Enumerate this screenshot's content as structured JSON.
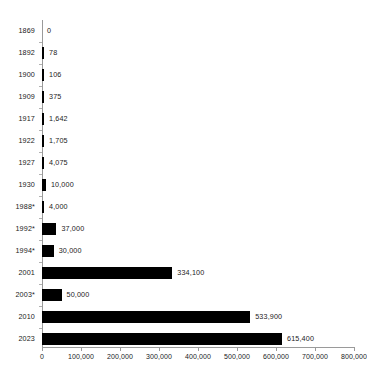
{
  "chart_data": {
    "type": "bar",
    "orientation": "horizontal",
    "title": "",
    "subtitle": "",
    "xlabel": "",
    "ylabel": "",
    "grid": false,
    "legend": null,
    "legend_position": "none",
    "xlim": [
      0,
      800000
    ],
    "x_ticks": [
      0,
      100000,
      200000,
      300000,
      400000,
      500000,
      600000,
      700000,
      800000
    ],
    "x_tick_labels": [
      "0",
      "100,000",
      "200,000",
      "300,000",
      "400,000",
      "500,000",
      "600,000",
      "700,000",
      "800,000"
    ],
    "categories": [
      "1869",
      "1892",
      "1900",
      "1909",
      "1917",
      "1922",
      "1927",
      "1930",
      "1988*",
      "1992*",
      "1994*",
      "2001",
      "2003*",
      "2010",
      "2023"
    ],
    "values": [
      0,
      78,
      106,
      375,
      1642,
      1705,
      4075,
      10000,
      4000,
      37000,
      30000,
      334100,
      50000,
      533900,
      615400
    ],
    "value_labels": [
      "0",
      "78",
      "106",
      "375",
      "1,642",
      "1,705",
      "4,075",
      "10,000",
      "4,000",
      "37,000",
      "30,000",
      "334,100",
      "50,000",
      "533,900",
      "615,400"
    ],
    "bar_color": "#000000",
    "axis_color": "#9a9a9a",
    "text_color": "#1a1a1a",
    "background_color": "#ffffff"
  }
}
